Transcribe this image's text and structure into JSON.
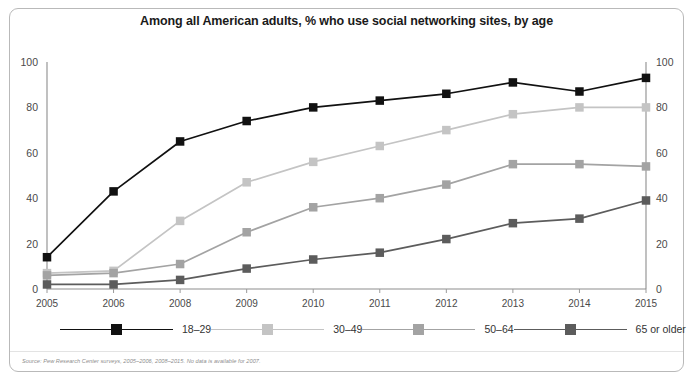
{
  "chart_data": {
    "type": "line",
    "title": "Among all American adults, % who use social networking sites, by age",
    "xlabel": "",
    "ylabel": "",
    "ylim": [
      0,
      100
    ],
    "yticks": [
      0,
      20,
      40,
      60,
      80,
      100
    ],
    "grid": false,
    "legend_position": "bottom",
    "dual_y_axis": true,
    "categories": [
      "2005",
      "2006",
      "2008",
      "2009",
      "2010",
      "2011",
      "2012",
      "2013",
      "2014",
      "2015"
    ],
    "series": [
      {
        "name": "18–29",
        "color": "#111111",
        "values": [
          14,
          43,
          65,
          74,
          80,
          83,
          86,
          91,
          87,
          93
        ]
      },
      {
        "name": "30–49",
        "color": "#c4c4c4",
        "values": [
          7,
          8,
          30,
          47,
          56,
          63,
          70,
          77,
          80,
          80
        ]
      },
      {
        "name": "50–64",
        "color": "#a3a3a3",
        "values": [
          6,
          7,
          11,
          25,
          36,
          40,
          46,
          55,
          55,
          54
        ]
      },
      {
        "name": "65 or older",
        "color": "#5c5c5c",
        "values": [
          2,
          2,
          4,
          9,
          13,
          16,
          22,
          29,
          31,
          39
        ]
      }
    ],
    "annotations": {
      "source": "Source: Pew Research Center surveys, 2005–2006, 2008–2015. No data is available for 2007."
    }
  },
  "legend": {
    "items": [
      {
        "label": "18–29"
      },
      {
        "label": "30–49"
      },
      {
        "label": "50–64"
      },
      {
        "label": "65 or older"
      }
    ]
  }
}
